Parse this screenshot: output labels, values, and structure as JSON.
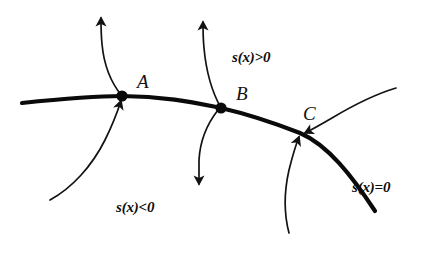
{
  "figure": {
    "background_color": "#ffffff",
    "ink_color": "#0a0a0a",
    "width": 434,
    "height": 253
  },
  "points": [
    {
      "id": "A",
      "label": "A",
      "has_dot": true,
      "x": 122,
      "y": 96,
      "label_x": 137,
      "label_y": 88
    },
    {
      "id": "B",
      "label": "B",
      "has_dot": true,
      "x": 221,
      "y": 108,
      "label_x": 236,
      "label_y": 100
    },
    {
      "id": "C",
      "label": "C",
      "has_dot": false,
      "x": 300,
      "y": 133,
      "label_x": 303,
      "label_y": 120
    }
  ],
  "region_labels": [
    {
      "id": "positive",
      "text": "s(x)>0",
      "x": 232,
      "y": 62
    },
    {
      "id": "negative",
      "text": "s(x)<0",
      "x": 116,
      "y": 212
    },
    {
      "id": "zero",
      "text": "s(x)=0",
      "x": 352,
      "y": 192
    }
  ],
  "manifold": {
    "name": "s(x)=0",
    "path": "M 22,103 C 60,99 95,96 122,96 C 165,96 196,103 221,108 C 256,116 282,126 300,133 C 328,145 352,176 375,211"
  },
  "flow_arrows": [
    {
      "id": "arrow-up-from-a",
      "direction": "outward-up",
      "path": "M 122,96 C 112,84 104,66 102,44 C 101,34 101,26 101,18"
    },
    {
      "id": "arrow-into-a-from-below",
      "direction": "inward-up",
      "path": "M 50,200 C 72,188 92,166 105,140 C 113,124 118,110 121,101"
    },
    {
      "id": "arrow-up-from-b",
      "direction": "outward-up",
      "path": "M 221,108 C 212,92 206,70 204,48 C 203,38 203,30 203,22"
    },
    {
      "id": "arrow-down-from-b",
      "direction": "outward-down",
      "path": "M 218,110 C 207,124 200,142 199,160 C 199,170 199,178 199,184"
    },
    {
      "id": "arrow-into-c-from-right",
      "direction": "inward-left",
      "path": "M 396,88 C 376,94 352,106 332,118 C 320,125 311,130 305,133"
    },
    {
      "id": "arrow-into-c-from-below",
      "direction": "inward-up",
      "path": "M 289,233 C 284,214 284,192 289,170 C 293,154 297,142 299,137"
    }
  ]
}
